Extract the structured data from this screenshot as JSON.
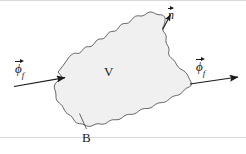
{
  "figure": {
    "colors": {
      "background": "#ffffff",
      "blob_fill": "#f0f0f0",
      "blob_stroke": "#555555",
      "ink": "#1a1a1a",
      "frame_rule": "#d8d8d8"
    },
    "labels": {
      "volume": "V",
      "boundary": "B",
      "normal_symbol": "n",
      "flux_symbol": "ϕ",
      "flux_subscript": "f"
    },
    "annotations": [
      {
        "name": "flux-in-label",
        "text": "ϕ",
        "subscript": "f",
        "vector": true,
        "x": 15,
        "y": 58
      },
      {
        "name": "flux-out-label",
        "text": "ϕ",
        "subscript": "f",
        "vector": true,
        "x": 196,
        "y": 56
      },
      {
        "name": "normal-vector-label",
        "text": "n",
        "subscript": "",
        "vector": true,
        "x": 168,
        "y": 5
      },
      {
        "name": "volume-label",
        "text": "V",
        "subscript": "",
        "vector": false,
        "x": 104,
        "y": 65
      },
      {
        "name": "boundary-label",
        "text": "B",
        "subscript": "",
        "vector": false,
        "x": 82,
        "y": 131
      }
    ],
    "arrows": {
      "flux_in": {
        "from_x": 14,
        "from_y": 86,
        "to_x": 66,
        "to_y": 77
      },
      "flux_out": {
        "from_x": 190,
        "from_y": 84,
        "to_x": 239,
        "to_y": 77
      },
      "normal": {
        "from_x": 163,
        "from_y": 29,
        "to_x": 171,
        "to_y": 14
      }
    },
    "leader_lines": {
      "boundary": {
        "from_x": 86,
        "from_y": 129,
        "to_x": 79,
        "to_y": 114
      }
    }
  }
}
